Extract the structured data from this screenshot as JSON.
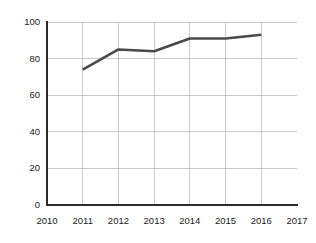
{
  "chart_data": {
    "type": "line",
    "title": "",
    "subtitle": "",
    "xlabel": "",
    "ylabel": "",
    "categories": [
      "2010",
      "2011",
      "2012",
      "2013",
      "2014",
      "2015",
      "2016",
      "2017"
    ],
    "x_tick_labels": [
      "2010",
      "2011",
      "2012",
      "2013",
      "2014",
      "2015",
      "2016",
      "2017"
    ],
    "y_tick_labels": [
      "0",
      "20",
      "40",
      "60",
      "80",
      "100"
    ],
    "y_ticks": [
      0,
      20,
      40,
      60,
      80,
      100
    ],
    "ylim": [
      0,
      100
    ],
    "xlim": [
      "2010",
      "2017"
    ],
    "grid": true,
    "grid_horizontal": true,
    "grid_vertical": true,
    "legend": false,
    "legend_position": "none",
    "series": [
      {
        "name": "",
        "x": [
          "2011",
          "2012",
          "2013",
          "2014",
          "2015",
          "2016"
        ],
        "values": [
          74,
          85,
          84,
          91,
          91,
          93
        ],
        "color": "#4a4a4a",
        "points": [
          {
            "x": "2010",
            "y": null
          },
          {
            "x": "2011",
            "y": 74
          },
          {
            "x": "2012",
            "y": 85
          },
          {
            "x": "2013",
            "y": 84
          },
          {
            "x": "2014",
            "y": 91
          },
          {
            "x": "2015",
            "y": 91
          },
          {
            "x": "2016",
            "y": 93
          },
          {
            "x": "2017",
            "y": null
          }
        ]
      }
    ],
    "colors": {
      "line": "#4a4a4a",
      "axis": "#2b2b2b",
      "grid": "#bdbdbd",
      "background": "#ffffff",
      "text": "#1a1a1a"
    }
  }
}
